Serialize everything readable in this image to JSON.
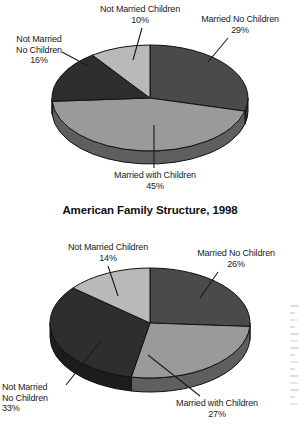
{
  "document": {
    "title": "American Family Structure, 1998",
    "background_color": "#ffffff",
    "text_color": "#1a1a1a"
  },
  "palette": {
    "married_no_children": "#4a4a4a",
    "married_with_children": "#9a9a9a",
    "not_married_no_children": "#2e2e2e",
    "not_married_children": "#b9b9b9",
    "outline": "#111111",
    "side_darken": 0.62
  },
  "charts": [
    {
      "id": "chart-top",
      "title": "",
      "geometry": {
        "cx": 150,
        "cy": 98,
        "rx": 98,
        "ry": 53,
        "depth": 13,
        "start_angle_deg": -90
      },
      "labels": [
        {
          "name": "not-married-children",
          "text": "Not Married Children",
          "pct": "10%",
          "x": 70,
          "y": 4,
          "w": 140,
          "align": "ctr",
          "leader": {
            "x1": 142,
            "y1": 28,
            "x2": 133,
            "y2": 60
          }
        },
        {
          "name": "married-no-children",
          "text": "Married No Children",
          "pct": "29%",
          "x": 180,
          "y": 14,
          "w": 120,
          "align": "ctr",
          "leader": {
            "x1": 228,
            "y1": 38,
            "x2": 208,
            "y2": 62
          }
        },
        {
          "name": "not-married-no-children",
          "text": "Not Married\nNo Children",
          "pct": "16%",
          "x": 2,
          "y": 34,
          "w": 74,
          "align": "ctr",
          "leader": {
            "x1": 62,
            "y1": 52,
            "x2": 88,
            "y2": 66
          }
        },
        {
          "name": "married-with-children",
          "text": "Married with Children",
          "pct": "45%",
          "x": 85,
          "y": 170,
          "w": 140,
          "align": "ctr",
          "leader": {
            "x1": 154,
            "y1": 125,
            "x2": 154,
            "y2": 168
          }
        }
      ]
    },
    {
      "id": "chart-bottom",
      "title": "American Family Structure, 1998",
      "geometry": {
        "cx": 150,
        "cy": 123,
        "rx": 100,
        "ry": 55,
        "depth": 14,
        "start_angle_deg": -90
      },
      "labels": [
        {
          "name": "not-married-children",
          "text": "Not Married Children",
          "pct": "14%",
          "x": 38,
          "y": 42,
          "w": 140,
          "align": "ctr",
          "leader": {
            "x1": 108,
            "y1": 66,
            "x2": 118,
            "y2": 96
          }
        },
        {
          "name": "married-no-children",
          "text": "Married No Children",
          "pct": "26%",
          "x": 175,
          "y": 48,
          "w": 122,
          "align": "ctr",
          "leader": {
            "x1": 218,
            "y1": 72,
            "x2": 200,
            "y2": 98
          }
        },
        {
          "name": "not-married-no-children",
          "text": "Not Married\nNo Children",
          "pct": "33%",
          "x": 2,
          "y": 182,
          "w": 78,
          "align": "lft",
          "leader": {
            "x1": 100,
            "y1": 142,
            "x2": 66,
            "y2": 185
          }
        },
        {
          "name": "married-with-children",
          "text": "Married with Children",
          "pct": "27%",
          "x": 152,
          "y": 198,
          "w": 130,
          "align": "ctr",
          "leader": {
            "x1": 148,
            "y1": 155,
            "x2": 200,
            "y2": 196
          }
        }
      ]
    }
  ],
  "chart_data": [
    {
      "type": "pie",
      "title": "",
      "chart_index": 0,
      "note": "Top pie (undated, earlier year) — American family structure shares",
      "categories": [
        "Married No Children",
        "Married with Children",
        "Not Married No Children",
        "Not Married Children"
      ],
      "values": [
        29,
        45,
        16,
        10
      ],
      "labels": [
        "29%",
        "45%",
        "16%",
        "10%"
      ],
      "units": "percent",
      "colors": [
        "#4a4a4a",
        "#9a9a9a",
        "#2e2e2e",
        "#b9b9b9"
      ],
      "legend": "none",
      "three_d": true,
      "start_angle_deg": -90,
      "direction": "clockwise",
      "total": 100
    },
    {
      "type": "pie",
      "title": "American Family Structure, 1998",
      "chart_index": 1,
      "categories": [
        "Married No Children",
        "Married with Children",
        "Not Married No Children",
        "Not Married Children"
      ],
      "values": [
        26,
        27,
        33,
        14
      ],
      "labels": [
        "26%",
        "27%",
        "33%",
        "14%"
      ],
      "units": "percent",
      "colors": [
        "#4a4a4a",
        "#9a9a9a",
        "#2e2e2e",
        "#b9b9b9"
      ],
      "legend": "none",
      "three_d": true,
      "start_angle_deg": -90,
      "direction": "clockwise",
      "total": 100
    }
  ]
}
